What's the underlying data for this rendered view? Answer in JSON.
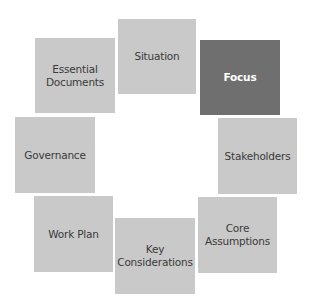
{
  "diagram": {
    "type": "circular-cycle",
    "colors": {
      "box": "#c9c9c9",
      "active_box": "#6f6f6f",
      "text": "#3a3a3a",
      "active_text": "#ffffff"
    },
    "nodes": [
      {
        "id": "situation",
        "label": "Situation",
        "active": false,
        "x": 118,
        "y": 19,
        "w": 78,
        "h": 75
      },
      {
        "id": "focus",
        "label": "Focus",
        "active": true,
        "x": 200,
        "y": 40,
        "w": 80,
        "h": 75
      },
      {
        "id": "stakeholders",
        "label": "Stakeholders",
        "active": false,
        "x": 218,
        "y": 118,
        "w": 79,
        "h": 76
      },
      {
        "id": "core-assumptions",
        "label": "Core\nAssumptions",
        "active": false,
        "x": 198,
        "y": 197,
        "w": 79,
        "h": 76
      },
      {
        "id": "key-considerations",
        "label": "Key\nConsiderations",
        "active": false,
        "x": 115,
        "y": 218,
        "w": 80,
        "h": 76
      },
      {
        "id": "work-plan",
        "label": "Work Plan",
        "active": false,
        "x": 34,
        "y": 196,
        "w": 79,
        "h": 76
      },
      {
        "id": "governance",
        "label": "Governance",
        "active": false,
        "x": 15,
        "y": 117,
        "w": 80,
        "h": 76
      },
      {
        "id": "essential-documents",
        "label": "Essential\nDocuments",
        "active": false,
        "x": 35,
        "y": 38,
        "w": 80,
        "h": 75
      }
    ]
  }
}
